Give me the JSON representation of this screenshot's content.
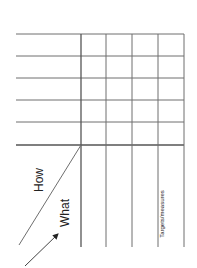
{
  "diagram": {
    "type": "qfd-matrix-rotated",
    "labels": {
      "how": "How",
      "what": "What",
      "targets": "Targets/measures"
    },
    "colors": {
      "line": "#6e6e6e",
      "thick_line": "#555555",
      "text": "#222222",
      "background": "#ffffff"
    },
    "grid": {
      "rows": 5,
      "columns": 4
    }
  }
}
